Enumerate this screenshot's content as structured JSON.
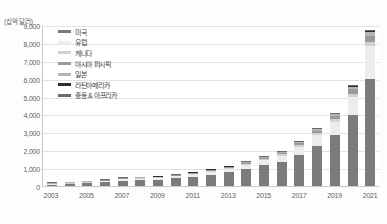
{
  "chart_data": {
    "type": "bar",
    "stacked": true,
    "title": "",
    "subtitle": "",
    "xlabel": "",
    "ylabel": "(십억 달러)",
    "y_unit_caption": "(십억 달러)",
    "ylim": [
      0,
      9000
    ],
    "ytick_values": [
      9000,
      8000,
      7000,
      6000,
      5000,
      4000,
      3000,
      2000,
      1000,
      0
    ],
    "ytick_labels": [
      "9,000",
      "8,000",
      "7,000",
      "6,000",
      "5,000",
      "4,000",
      "3,000",
      "2,000",
      "1,000",
      "0"
    ],
    "grid": true,
    "grid_axis": "y",
    "legend_position": "top-left-inside",
    "categories": [
      "2003",
      "2004",
      "2005",
      "2006",
      "2007",
      "2008",
      "2009",
      "2010",
      "2011",
      "2012",
      "2013",
      "2014",
      "2015",
      "2016",
      "2017",
      "2018",
      "2019",
      "2020",
      "2021"
    ],
    "xtick_labels_shown": [
      "2003",
      "",
      "2005",
      "",
      "2007",
      "",
      "2009",
      "",
      "2011",
      "",
      "2013",
      "",
      "2015",
      "",
      "2017",
      "",
      "2019",
      "",
      "2021"
    ],
    "series": [
      {
        "name": "미국",
        "color": "#7b7b7b",
        "values": [
          75,
          105,
          150,
          215,
          300,
          330,
          360,
          430,
          530,
          640,
          760,
          950,
          1150,
          1350,
          1750,
          2250,
          2850,
          3950,
          6000
        ]
      },
      {
        "name": "유럽",
        "color": "#ededed",
        "values": [
          20,
          28,
          40,
          58,
          80,
          88,
          96,
          115,
          140,
          170,
          200,
          250,
          300,
          350,
          450,
          580,
          730,
          1000,
          1800
        ]
      },
      {
        "name": "캐나다",
        "color": "#d2d2d2",
        "values": [
          4,
          5,
          8,
          11,
          15,
          17,
          18,
          22,
          27,
          32,
          38,
          48,
          58,
          67,
          86,
          111,
          140,
          192,
          260
        ]
      },
      {
        "name": "아시아 퍼시픽",
        "color": "#9a9a9a",
        "values": [
          5,
          7,
          10,
          14,
          20,
          22,
          24,
          29,
          35,
          42,
          50,
          63,
          76,
          89,
          115,
          148,
          187,
          256,
          345
        ]
      },
      {
        "name": "일본",
        "color": "#b4b4b4",
        "values": [
          3,
          4,
          6,
          8,
          11,
          12,
          13,
          16,
          19,
          23,
          28,
          35,
          42,
          49,
          63,
          81,
          103,
          141,
          190
        ]
      },
      {
        "name": "라틴아메리카",
        "color": "#2e2e2e",
        "values": [
          1,
          2,
          2,
          3,
          4,
          5,
          5,
          6,
          8,
          9,
          11,
          14,
          17,
          20,
          25,
          33,
          41,
          56,
          76
        ]
      },
      {
        "name": "중동 & 아프리카",
        "color": "#6a6a6a",
        "values": [
          1,
          1,
          2,
          3,
          4,
          4,
          5,
          6,
          7,
          8,
          10,
          13,
          15,
          18,
          23,
          30,
          37,
          51,
          69
        ]
      }
    ],
    "totals": [
      109,
      152,
      218,
      312,
      434,
      478,
      521,
      624,
      766,
      924,
      1097,
      1373,
      1658,
      1943,
      2512,
      3233,
      4088,
      5646,
      8740
    ]
  },
  "legend": {
    "items": [
      {
        "label": "미국"
      },
      {
        "label": "유럽"
      },
      {
        "label": "캐나다"
      },
      {
        "label": "아시아 퍼시픽"
      },
      {
        "label": "일본"
      },
      {
        "label": "라틴아메리카"
      },
      {
        "label": "중동 & 아프리카"
      }
    ]
  }
}
